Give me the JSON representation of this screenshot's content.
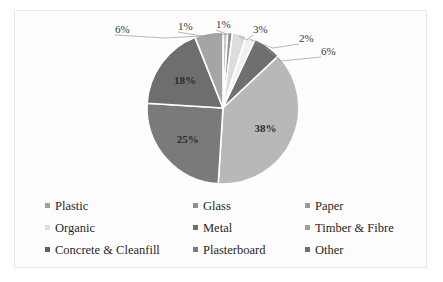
{
  "chart_data": {
    "type": "pie",
    "title": "",
    "legend_position": "bottom",
    "categories": [
      "Plastic",
      "Glass",
      "Paper",
      "Organic",
      "Metal",
      "Timber & Fibre",
      "Concrete & Cleanfill",
      "Plasterboard",
      "Other"
    ],
    "values": [
      1,
      1,
      3,
      2,
      6,
      38,
      25,
      18,
      6
    ],
    "labels": [
      "1%",
      "1%",
      "3%",
      "2%",
      "6%",
      "38%",
      "25%",
      "18%",
      "6%"
    ],
    "colors": [
      "#c9c9c9",
      "#8f8f8f",
      "#dcdcdc",
      "#f0f0f0",
      "#6f6f6f",
      "#b8b8b8",
      "#7a7a7a",
      "#6e6e6e",
      "#a5a5a5"
    ],
    "slices": [
      {
        "name": "Plastic",
        "value": 1,
        "label": "1%",
        "color": "#c9c9c9",
        "label_placement": "callout"
      },
      {
        "name": "Glass",
        "value": 1,
        "label": "1%",
        "color": "#8f8f8f",
        "label_placement": "callout"
      },
      {
        "name": "Paper",
        "value": 3,
        "label": "3%",
        "color": "#dcdcdc",
        "label_placement": "callout"
      },
      {
        "name": "Organic",
        "value": 2,
        "label": "2%",
        "color": "#f0f0f0",
        "label_placement": "callout"
      },
      {
        "name": "Metal",
        "value": 6,
        "label": "6%",
        "color": "#6f6f6f",
        "label_placement": "callout"
      },
      {
        "name": "Timber & Fibre",
        "value": 38,
        "label": "38%",
        "color": "#b8b8b8",
        "label_placement": "inside"
      },
      {
        "name": "Concrete & Cleanfill",
        "value": 25,
        "label": "25%",
        "color": "#7a7a7a",
        "label_placement": "inside"
      },
      {
        "name": "Plasterboard",
        "value": 18,
        "label": "18%",
        "color": "#6e6e6e",
        "label_placement": "inside"
      },
      {
        "name": "Other",
        "value": 6,
        "label": "6%",
        "color": "#a5a5a5",
        "label_placement": "callout"
      }
    ]
  },
  "legend": {
    "rows": [
      [
        {
          "label": "Plastic",
          "color": "#a0a0a0"
        },
        {
          "label": "Glass",
          "color": "#8f8f8f"
        },
        {
          "label": "Paper",
          "color": "#9a9a9a"
        }
      ],
      [
        {
          "label": "Organic",
          "color": "#dedede"
        },
        {
          "label": "Metal",
          "color": "#6f6f6f"
        },
        {
          "label": "Timber & Fibre",
          "color": "#9d9d9d"
        }
      ],
      [
        {
          "label": "Concrete & Cleanfill",
          "color": "#5f5f5f"
        },
        {
          "label": "Plasterboard",
          "color": "#7a7a7a"
        },
        {
          "label": "Other",
          "color": "#6e6e6e"
        }
      ]
    ]
  }
}
